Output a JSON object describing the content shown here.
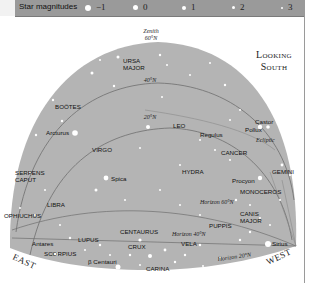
{
  "legend": {
    "title": "Star magnitudes",
    "items": [
      {
        "label": "−1",
        "size": 7
      },
      {
        "label": "0",
        "size": 5.5
      },
      {
        "label": "1",
        "size": 4.5
      },
      {
        "label": "2",
        "size": 3.5
      },
      {
        "label": "3",
        "size": 2.2
      }
    ]
  },
  "orientation": {
    "line1": "Looking",
    "line2": "South"
  },
  "directions": {
    "east": "EAST",
    "west": "WEST"
  },
  "circles": {
    "zenith_line1": "Zenith",
    "zenith_line2": "60°N",
    "lat40": "40°N",
    "lat20": "20°N",
    "ecliptic": "Ecliptic",
    "horizon60": "Horizon 60°N",
    "horizon40": "Horizon 40°N",
    "horizon20": "Horizon 20°N"
  },
  "constellations": {
    "ursa_major_1": "URSA",
    "ursa_major_2": "MAJOR",
    "bootes": "BOÖTES",
    "virgo": "VIRGO",
    "leo": "LEO",
    "cancer": "CANCER",
    "hydra": "HYDRA",
    "gemini": "GEMINI",
    "monoceros": "MONOCEROS",
    "serpens_1": "SERPENS",
    "serpens_2": "CAPUT",
    "ophiuchus": "OPHIUCHUS",
    "libra": "LIBRA",
    "scorpius": "SCORPIUS",
    "lupus": "LUPUS",
    "centaurus": "CENTAURUS",
    "crux": "CRUX",
    "vela": "VELA",
    "puppis": "PUPPIS",
    "canis_major_1": "CANIS",
    "canis_major_2": "MAJOR",
    "carina": "CARINA"
  },
  "stars": {
    "arcturus": "Arcturus",
    "spica": "Spica",
    "regulus": "Regulus",
    "castor": "Castor",
    "pollux": "Pollux",
    "procyon": "Procyon",
    "sirius": "Sirius",
    "antares": "Antares",
    "beta_centauri": "β Centauri"
  },
  "colors": {
    "sky": "#b4b4b4",
    "legend_bar": "#9a9a9a",
    "lines": "#6e6e6e",
    "star": "#ffffff"
  }
}
